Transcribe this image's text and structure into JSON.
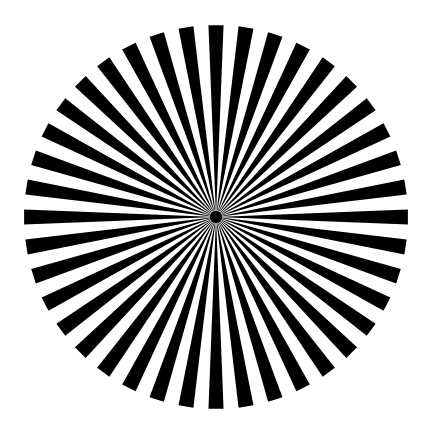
{
  "pattern": {
    "name": "Siemens star",
    "spoke_count": 40,
    "spoke_angle_deg": 4.5,
    "period_deg": 9,
    "first_spoke_angle_deg": 0,
    "center": [
      216,
      217
    ],
    "radius": 192,
    "colors": {
      "spoke": "#000000",
      "background": "#ffffff"
    }
  }
}
